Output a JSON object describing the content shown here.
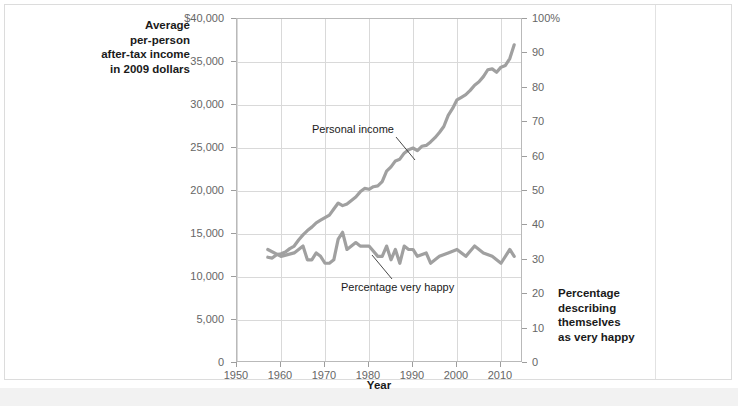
{
  "axes": {
    "left_caption": "Average per-person after-tax income in 2009 dollars",
    "left_caption_lines": [
      "Average",
      "per-person",
      "after-tax income",
      "in 2009 dollars"
    ],
    "right_caption_lines": [
      "Percentage",
      "describing",
      "themselves",
      "as very happy"
    ],
    "x_title": "Year"
  },
  "chart_data": {
    "type": "line",
    "title": "",
    "xlabel": "Year",
    "ylabel": "Average per-person after-tax income in 2009 dollars",
    "y2label": "Percentage describing themselves as very happy",
    "grid": true,
    "legend": "annotations",
    "xlim": [
      1950,
      2015
    ],
    "xticks": [
      1950,
      1960,
      1970,
      1980,
      1990,
      2000,
      2010
    ],
    "xticklabels": [
      "1950",
      "1960",
      "1970",
      "1980",
      "1990",
      "2000",
      "2010"
    ],
    "ylim": [
      0,
      40000
    ],
    "yticks": [
      0,
      5000,
      10000,
      15000,
      20000,
      25000,
      30000,
      35000,
      40000
    ],
    "yticklabels": [
      "0",
      "5,000",
      "10,000",
      "15,000",
      "20,000",
      "25,000",
      "30,000",
      "35,000",
      "$40,000"
    ],
    "y2lim": [
      0,
      100
    ],
    "y2ticks": [
      0,
      10,
      20,
      30,
      40,
      50,
      60,
      70,
      80,
      90,
      100
    ],
    "y2ticklabels": [
      "0",
      "10",
      "20",
      "30",
      "40",
      "50",
      "60",
      "70",
      "80",
      "90",
      "100%"
    ],
    "line_color": "#a0a0a0",
    "series": [
      {
        "name": "Personal income",
        "axis": "left",
        "units": "2009 dollars",
        "x": [
          1957,
          1958,
          1959,
          1960,
          1961,
          1962,
          1963,
          1964,
          1965,
          1966,
          1967,
          1968,
          1969,
          1970,
          1971,
          1972,
          1973,
          1974,
          1975,
          1976,
          1977,
          1978,
          1979,
          1980,
          1981,
          1982,
          1983,
          1984,
          1985,
          1986,
          1987,
          1988,
          1989,
          1990,
          1991,
          1992,
          1993,
          1994,
          1995,
          1996,
          1997,
          1998,
          1999,
          2000,
          2001,
          2002,
          2003,
          2004,
          2005,
          2006,
          2007,
          2008,
          2009,
          2010,
          2011,
          2012,
          2013
        ],
        "values": [
          12300,
          12200,
          12600,
          12700,
          12900,
          13300,
          13600,
          14300,
          14900,
          15400,
          15800,
          16300,
          16600,
          16900,
          17200,
          17900,
          18600,
          18300,
          18500,
          18900,
          19300,
          19900,
          20300,
          20200,
          20500,
          20600,
          21100,
          22300,
          22800,
          23500,
          23700,
          24400,
          24800,
          25000,
          24700,
          25200,
          25300,
          25700,
          26200,
          26800,
          27500,
          28800,
          29600,
          30600,
          30900,
          31200,
          31700,
          32300,
          32700,
          33300,
          34100,
          34200,
          33800,
          34400,
          34600,
          35400,
          37000
        ]
      },
      {
        "name": "Percentage very happy",
        "axis": "right",
        "units": "percent",
        "x": [
          1957,
          1960,
          1963,
          1965,
          1966,
          1967,
          1968,
          1969,
          1970,
          1971,
          1972,
          1973,
          1974,
          1975,
          1976,
          1977,
          1978,
          1980,
          1982,
          1983,
          1984,
          1985,
          1986,
          1987,
          1988,
          1989,
          1990,
          1991,
          1993,
          1994,
          1996,
          1998,
          2000,
          2002,
          2004,
          2006,
          2008,
          2010,
          2012,
          2013
        ],
        "values": [
          33,
          31,
          32,
          34,
          30,
          30,
          32,
          31,
          29,
          29,
          30,
          36,
          38,
          33,
          34,
          35,
          34,
          34,
          31,
          31,
          34,
          30,
          33,
          29,
          34,
          33,
          33,
          31,
          32,
          29,
          31,
          32,
          33,
          31,
          34,
          32,
          31,
          29,
          33,
          31
        ]
      }
    ],
    "annotations": [
      {
        "text": "Personal income",
        "series": "Personal income"
      },
      {
        "text": "Percentage very happy",
        "series": "Percentage very happy"
      }
    ]
  }
}
